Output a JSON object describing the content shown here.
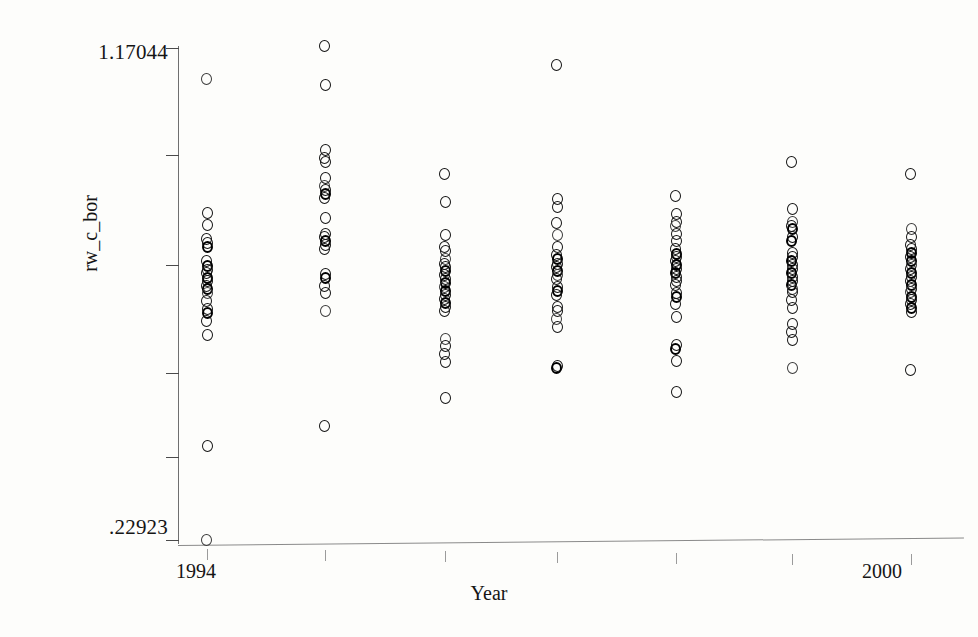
{
  "figure": {
    "ytitle": "rw_c_bor",
    "xtitle": "Year",
    "y_top_label": "1.17044",
    "y_bottom_label": ".22923",
    "x_left_label": "1994",
    "x_right_label": "2000",
    "point_glyph": "open-circle",
    "ink_color": "#141414",
    "axis_color": "#6f6f6f",
    "background_color": "#fdfdfb"
  },
  "chart_data": {
    "type": "scatter",
    "title": "",
    "subtitle": "",
    "xlabel": "Year",
    "ylabel": "rw_c_bor",
    "grid": false,
    "legend": "none",
    "annotations": [],
    "xlim": [
      1994,
      2000
    ],
    "ylim": [
      0.22923,
      1.17044
    ],
    "xticks": [
      1994,
      1995,
      1996,
      1997,
      1998,
      1999,
      2000
    ],
    "xticklabels": [
      "1994",
      "",
      "",
      "",
      "",
      "",
      "2000"
    ],
    "yticks": [
      0.22923,
      0.42,
      0.62,
      0.81,
      1.0,
      1.17044
    ],
    "yticklabels": [
      ".22923",
      "",
      "",
      "",
      "",
      "1.17044"
    ],
    "note": "Strip / column scatter: one vertical column of open circles per year; heavy overplotting in mid-range. Values estimated from pixel positions against the two labelled y-axis anchors.",
    "series": [
      {
        "name": "rw_c_bor",
        "marker": "open-circle",
        "x": [
          1994,
          1995,
          1996,
          1997,
          1998,
          1999,
          2000
        ],
        "columns": [
          {
            "year": 1994,
            "n": 22,
            "values": [
              1.108,
              0.852,
              0.829,
              0.803,
              0.795,
              0.787,
              0.76,
              0.752,
              0.744,
              0.737,
              0.729,
              0.722,
              0.714,
              0.707,
              0.699,
              0.684,
              0.669,
              0.661,
              0.646,
              0.62,
              0.409,
              0.229
            ]
          },
          {
            "year": 1995,
            "n": 22,
            "values": [
              1.17,
              1.097,
              0.972,
              0.957,
              0.949,
              0.918,
              0.903,
              0.896,
              0.888,
              0.881,
              0.843,
              0.813,
              0.806,
              0.798,
              0.791,
              0.783,
              0.736,
              0.729,
              0.714,
              0.699,
              0.665,
              0.446
            ]
          },
          {
            "year": 1996,
            "n": 24,
            "values": [
              0.926,
              0.873,
              0.81,
              0.787,
              0.779,
              0.764,
              0.756,
              0.749,
              0.741,
              0.734,
              0.726,
              0.719,
              0.711,
              0.704,
              0.696,
              0.689,
              0.681,
              0.674,
              0.666,
              0.613,
              0.598,
              0.583,
              0.568,
              0.5
            ]
          },
          {
            "year": 1997,
            "n": 22,
            "values": [
              1.134,
              0.879,
              0.864,
              0.833,
              0.81,
              0.787,
              0.772,
              0.764,
              0.756,
              0.749,
              0.741,
              0.734,
              0.726,
              0.711,
              0.704,
              0.696,
              0.674,
              0.666,
              0.651,
              0.636,
              0.56,
              0.556
            ]
          },
          {
            "year": 1998,
            "n": 24,
            "values": [
              0.884,
              0.851,
              0.836,
              0.828,
              0.813,
              0.798,
              0.783,
              0.775,
              0.768,
              0.76,
              0.753,
              0.745,
              0.738,
              0.73,
              0.723,
              0.715,
              0.7,
              0.693,
              0.678,
              0.655,
              0.6,
              0.593,
              0.57,
              0.512
            ]
          },
          {
            "year": 1999,
            "n": 24,
            "values": [
              0.949,
              0.859,
              0.836,
              0.828,
              0.821,
              0.806,
              0.798,
              0.776,
              0.768,
              0.761,
              0.753,
              0.746,
              0.738,
              0.731,
              0.723,
              0.716,
              0.708,
              0.701,
              0.686,
              0.671,
              0.641,
              0.626,
              0.611,
              0.556
            ]
          },
          {
            "year": 2000,
            "n": 22,
            "values": [
              0.926,
              0.821,
              0.806,
              0.791,
              0.783,
              0.776,
              0.768,
              0.761,
              0.753,
              0.746,
              0.738,
              0.731,
              0.723,
              0.716,
              0.708,
              0.701,
              0.693,
              0.686,
              0.678,
              0.671,
              0.663,
              0.553
            ]
          }
        ]
      }
    ]
  },
  "geometry": {
    "column_x_px": [
      207,
      325,
      445,
      557,
      676,
      792,
      911
    ],
    "y_top_px": 46,
    "y_bottom_px": 540,
    "ytick_y_px": [
      48,
      155,
      265,
      373,
      457,
      540
    ],
    "xtick_x_px": [
      207,
      325,
      445,
      557,
      676,
      792,
      911
    ]
  }
}
